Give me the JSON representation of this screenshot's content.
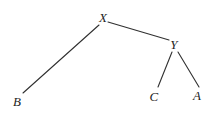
{
  "diagram": {
    "type": "tree",
    "width": 214,
    "height": 113,
    "background_color": "#ffffff",
    "edge_color": "#303030",
    "label_color": "#1d1d1d",
    "edge_width": 1.1,
    "nodes": [
      {
        "id": "X",
        "label": "X",
        "x": 103,
        "y": 17
      },
      {
        "id": "Y",
        "label": "Y",
        "x": 174,
        "y": 44
      },
      {
        "id": "B",
        "label": "B",
        "x": 17,
        "y": 101
      },
      {
        "id": "C",
        "label": "C",
        "x": 154,
        "y": 96
      },
      {
        "id": "A",
        "label": "A",
        "x": 197,
        "y": 95
      }
    ],
    "edges": [
      {
        "from": "X",
        "to": "B",
        "x1": 99,
        "y1": 25,
        "x2": 23,
        "y2": 93
      },
      {
        "from": "X",
        "to": "Y",
        "x1": 108,
        "y1": 22,
        "x2": 169,
        "y2": 40
      },
      {
        "from": "Y",
        "to": "C",
        "x1": 172,
        "y1": 52,
        "x2": 158,
        "y2": 87
      },
      {
        "from": "Y",
        "to": "A",
        "x1": 178,
        "y1": 52,
        "x2": 199,
        "y2": 87
      }
    ]
  }
}
